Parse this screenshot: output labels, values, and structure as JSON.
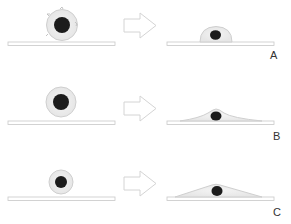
{
  "diagram": {
    "title": "",
    "colors": {
      "background": "#ffffff",
      "substrate_fill": "#ffffff",
      "substrate_stroke": "#c8c8c8",
      "cell_fill": "#ececec",
      "cell_stroke": "#cfcfcf",
      "nucleus": "#1c1c1c",
      "arrow_stroke": "#d4d4d4",
      "label": "#333333"
    },
    "rows": [
      {
        "label": "A",
        "before": "rounded cell with membrane protrusions",
        "after": "dome-shaped attached cell"
      },
      {
        "label": "B",
        "before": "rounded cell",
        "after": "flattened spread cell"
      },
      {
        "label": "C",
        "before": "small rounded cell",
        "after": "triangular spread cell"
      }
    ],
    "arrow_icon": "hollow-right-arrow"
  }
}
